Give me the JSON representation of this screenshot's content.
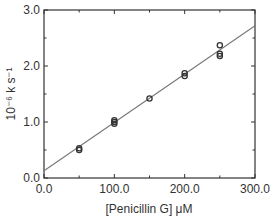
{
  "chart_data": {
    "type": "scatter",
    "title": "",
    "xlabel": "[Penicillin G] μM",
    "ylabel": "10⁻⁶ k s⁻¹",
    "xlim": [
      0,
      300
    ],
    "ylim": [
      0,
      3.0
    ],
    "x_ticks": [
      "0.0",
      "100.0",
      "200.0",
      "300.0"
    ],
    "y_ticks": [
      "0.0",
      "1.0",
      "2.0",
      "3.0"
    ],
    "grid": false,
    "legend": null,
    "series": [
      {
        "name": "measured",
        "marker": "open-circle",
        "points": [
          {
            "x": 50,
            "y": 0.5
          },
          {
            "x": 50,
            "y": 0.53
          },
          {
            "x": 100,
            "y": 0.97
          },
          {
            "x": 100,
            "y": 1.0
          },
          {
            "x": 100,
            "y": 1.03
          },
          {
            "x": 150,
            "y": 1.42
          },
          {
            "x": 200,
            "y": 1.82
          },
          {
            "x": 200,
            "y": 1.87
          },
          {
            "x": 250,
            "y": 2.18
          },
          {
            "x": 250,
            "y": 2.22
          },
          {
            "x": 250,
            "y": 2.37
          }
        ]
      },
      {
        "name": "linear fit",
        "type": "line",
        "points": [
          {
            "x": 0,
            "y": 0.13
          },
          {
            "x": 300,
            "y": 2.72
          }
        ]
      }
    ],
    "colors": {
      "axis": "#333333",
      "marker": "#333333",
      "fit_line": "#777777"
    }
  }
}
